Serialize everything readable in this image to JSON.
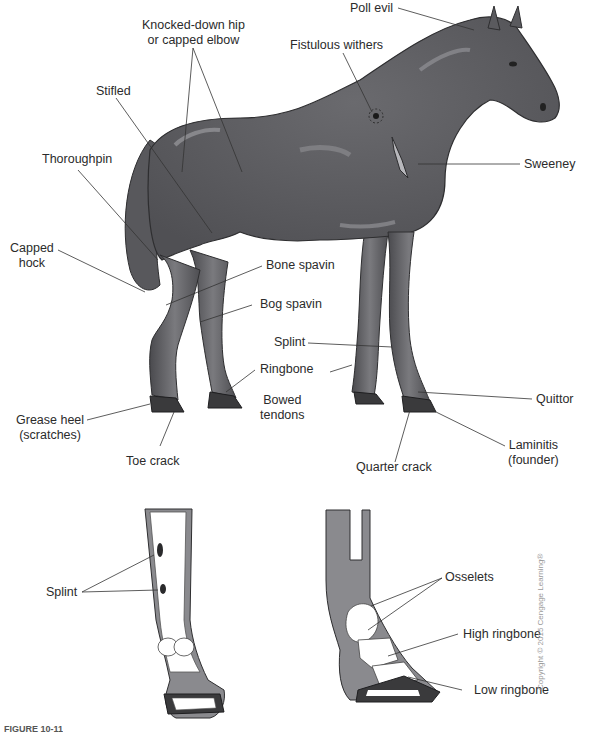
{
  "figure": {
    "caption_partial": "FIGURE 10-11",
    "copyright": "Copyright © 2015 Cengage Learning®",
    "colors": {
      "body": "#5e5e62",
      "body_shadow": "#48484c",
      "highlight": "#8c8c90",
      "outline": "#2e2e30",
      "hoof": "#3a3a3c",
      "bone": "#ffffff",
      "leader": "#333333"
    }
  },
  "horse_labels": [
    {
      "id": "knocked-down-hip",
      "line1": "Knocked-down hip",
      "line2": "or capped elbow"
    },
    {
      "id": "poll-evil",
      "line1": "Poll evil"
    },
    {
      "id": "fistulous-withers",
      "line1": "Fistulous withers"
    },
    {
      "id": "stifled",
      "line1": "Stifled"
    },
    {
      "id": "thoroughpin",
      "line1": "Thoroughpin"
    },
    {
      "id": "sweeney",
      "line1": "Sweeney"
    },
    {
      "id": "capped-hock",
      "line1": "Capped",
      "line2": "hock"
    },
    {
      "id": "bone-spavin",
      "line1": "Bone spavin"
    },
    {
      "id": "bog-spavin",
      "line1": "Bog spavin"
    },
    {
      "id": "splint",
      "line1": "Splint"
    },
    {
      "id": "ringbone",
      "line1": "Ringbone"
    },
    {
      "id": "bowed-tendons",
      "line1": "Bowed",
      "line2": "tendons"
    },
    {
      "id": "quittor",
      "line1": "Quittor"
    },
    {
      "id": "grease-heel",
      "line1": "Grease heel",
      "line2": "(scratches)"
    },
    {
      "id": "toe-crack",
      "line1": "Toe crack"
    },
    {
      "id": "quarter-crack",
      "line1": "Quarter crack"
    },
    {
      "id": "laminitis",
      "line1": "Laminitis",
      "line2": "(founder)"
    }
  ],
  "leg_front_labels": [
    {
      "id": "splint-detail",
      "line1": "Splint"
    }
  ],
  "leg_side_labels": [
    {
      "id": "osselets",
      "line1": "Osselets"
    },
    {
      "id": "high-ringbone",
      "line1": "High ringbone"
    },
    {
      "id": "low-ringbone",
      "line1": "Low ringbone"
    }
  ]
}
